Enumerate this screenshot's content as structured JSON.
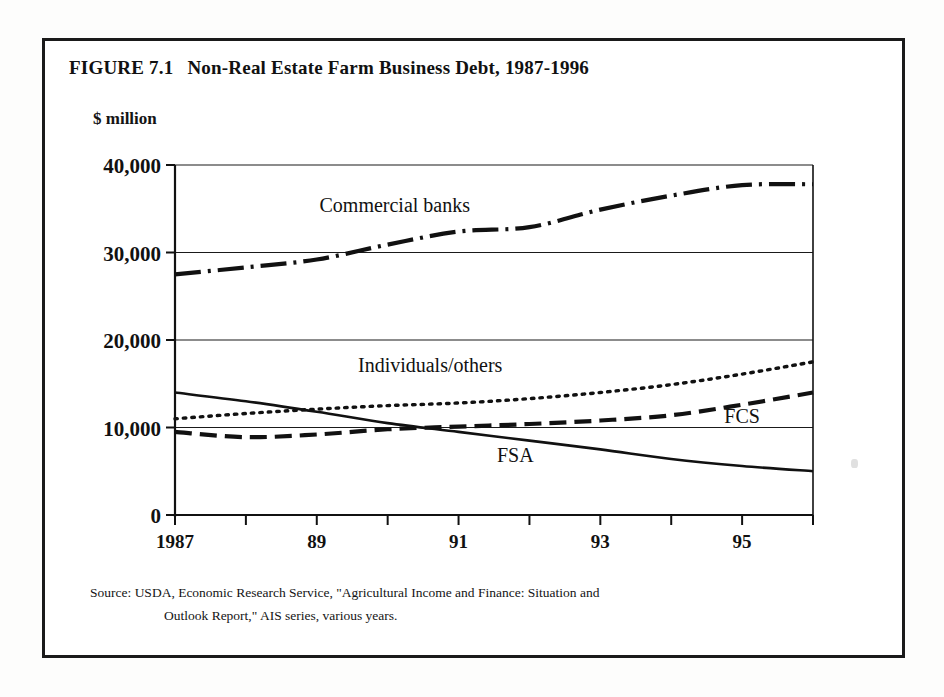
{
  "figure": {
    "number": "FIGURE 7.1",
    "title": "Non-Real Estate Farm Business Debt, 1987-1996",
    "unit_label": "$ million",
    "source_label": "Source:",
    "source_line1": "USDA, Economic Research Service, \"Agricultural Income and Finance: Situation and",
    "source_line2": "Outlook Report,\" AIS series, various years."
  },
  "chart_data": {
    "type": "line",
    "title": "Non-Real Estate Farm Business Debt, 1987-1996",
    "xlabel": "",
    "ylabel": "$ million",
    "x": [
      1987,
      1988,
      1989,
      1990,
      1991,
      1992,
      1993,
      1994,
      1995,
      1996
    ],
    "xtick_values": [
      1987,
      1988,
      1989,
      1990,
      1991,
      1992,
      1993,
      1994,
      1995,
      1996
    ],
    "xtick_labels": [
      "1987",
      "",
      "89",
      "",
      "91",
      "",
      "93",
      "",
      "95",
      ""
    ],
    "xlim": [
      1987,
      1996
    ],
    "ytick_values": [
      0,
      10000,
      20000,
      30000,
      40000
    ],
    "ytick_labels": [
      "0",
      "10,000",
      "20,000",
      "30,000",
      "40,000"
    ],
    "ylim": [
      0,
      40000
    ],
    "grid": true,
    "grid_axis": "y",
    "legend": "inline-annotations",
    "series": [
      {
        "name": "Commercial banks",
        "style": "dash-dot",
        "color": "#111111",
        "label_x": 1990.1,
        "label_y": 34600,
        "values": [
          27500,
          28300,
          29200,
          30900,
          32400,
          32900,
          34900,
          36500,
          37700,
          37800
        ]
      },
      {
        "name": "Individuals/others",
        "style": "dotted",
        "color": "#111111",
        "label_x": 1990.6,
        "label_y": 16400,
        "values": [
          11000,
          11600,
          12100,
          12500,
          12800,
          13300,
          14000,
          14900,
          16100,
          17500
        ]
      },
      {
        "name": "FCS",
        "style": "dashed",
        "color": "#111111",
        "label_x": 1995.0,
        "label_y": 10500,
        "values": [
          9500,
          8900,
          9200,
          9800,
          10100,
          10400,
          10800,
          11400,
          12600,
          14000
        ]
      },
      {
        "name": "FSA",
        "style": "solid",
        "color": "#111111",
        "label_x": 1991.8,
        "label_y": 6100,
        "values": [
          14000,
          13000,
          11800,
          10500,
          9500,
          8500,
          7500,
          6400,
          5600,
          5000
        ]
      }
    ]
  }
}
